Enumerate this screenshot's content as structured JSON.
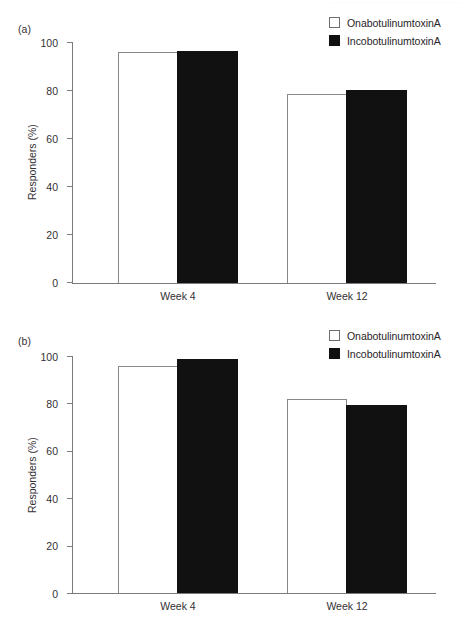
{
  "chart_data": [
    {
      "type": "bar",
      "panel": "(a)",
      "title": "",
      "xlabel": "",
      "ylabel": "Responders (%)",
      "categories": [
        "Week 4",
        "Week 12"
      ],
      "ylim": [
        0,
        100
      ],
      "yticks": [
        0,
        20,
        40,
        60,
        80,
        100
      ],
      "grid": false,
      "legend_position": "top-right",
      "series": [
        {
          "name": "OnabotulinumtoxinA",
          "style": "open",
          "color": "#ffffff",
          "values": [
            95.8,
            78.4
          ]
        },
        {
          "name": "IncobotulinumtoxinA",
          "style": "solid",
          "color": "#111111",
          "values": [
            96.3,
            80.1
          ]
        }
      ]
    },
    {
      "type": "bar",
      "panel": "(b)",
      "title": "",
      "xlabel": "",
      "ylabel": "Responders (%)",
      "categories": [
        "Week 4",
        "Week 12"
      ],
      "ylim": [
        0,
        100
      ],
      "yticks": [
        0,
        20,
        40,
        60,
        80,
        100
      ],
      "grid": false,
      "legend_position": "top-right",
      "series": [
        {
          "name": "OnabotulinumtoxinA",
          "style": "open",
          "color": "#ffffff",
          "values": [
            95.6,
            81.8
          ]
        },
        {
          "name": "IncobotulinumtoxinA",
          "style": "solid",
          "color": "#111111",
          "values": [
            98.8,
            79.4
          ]
        }
      ]
    }
  ],
  "panels": {
    "a": {
      "label": "(a)",
      "ylabel": "Responders (%)",
      "tick_labels": [
        "100",
        "80",
        "60",
        "40",
        "20",
        "0"
      ],
      "categories": [
        "Week 4",
        "Week 12"
      ],
      "legend": [
        {
          "label": "OnabotulinumtoxinA",
          "swatch": "open-square-swatch"
        },
        {
          "label": "IncobotulinumtoxinA",
          "swatch": "filled-square-swatch"
        }
      ]
    },
    "b": {
      "label": "(b)",
      "ylabel": "Responders (%)",
      "tick_labels": [
        "100",
        "80",
        "60",
        "40",
        "20",
        "0"
      ],
      "categories": [
        "Week 4",
        "Week 12"
      ],
      "legend": [
        {
          "label": "OnabotulinumtoxinA",
          "swatch": "open-square-swatch"
        },
        {
          "label": "IncobotulinumtoxinA",
          "swatch": "filled-square-swatch"
        }
      ]
    }
  }
}
